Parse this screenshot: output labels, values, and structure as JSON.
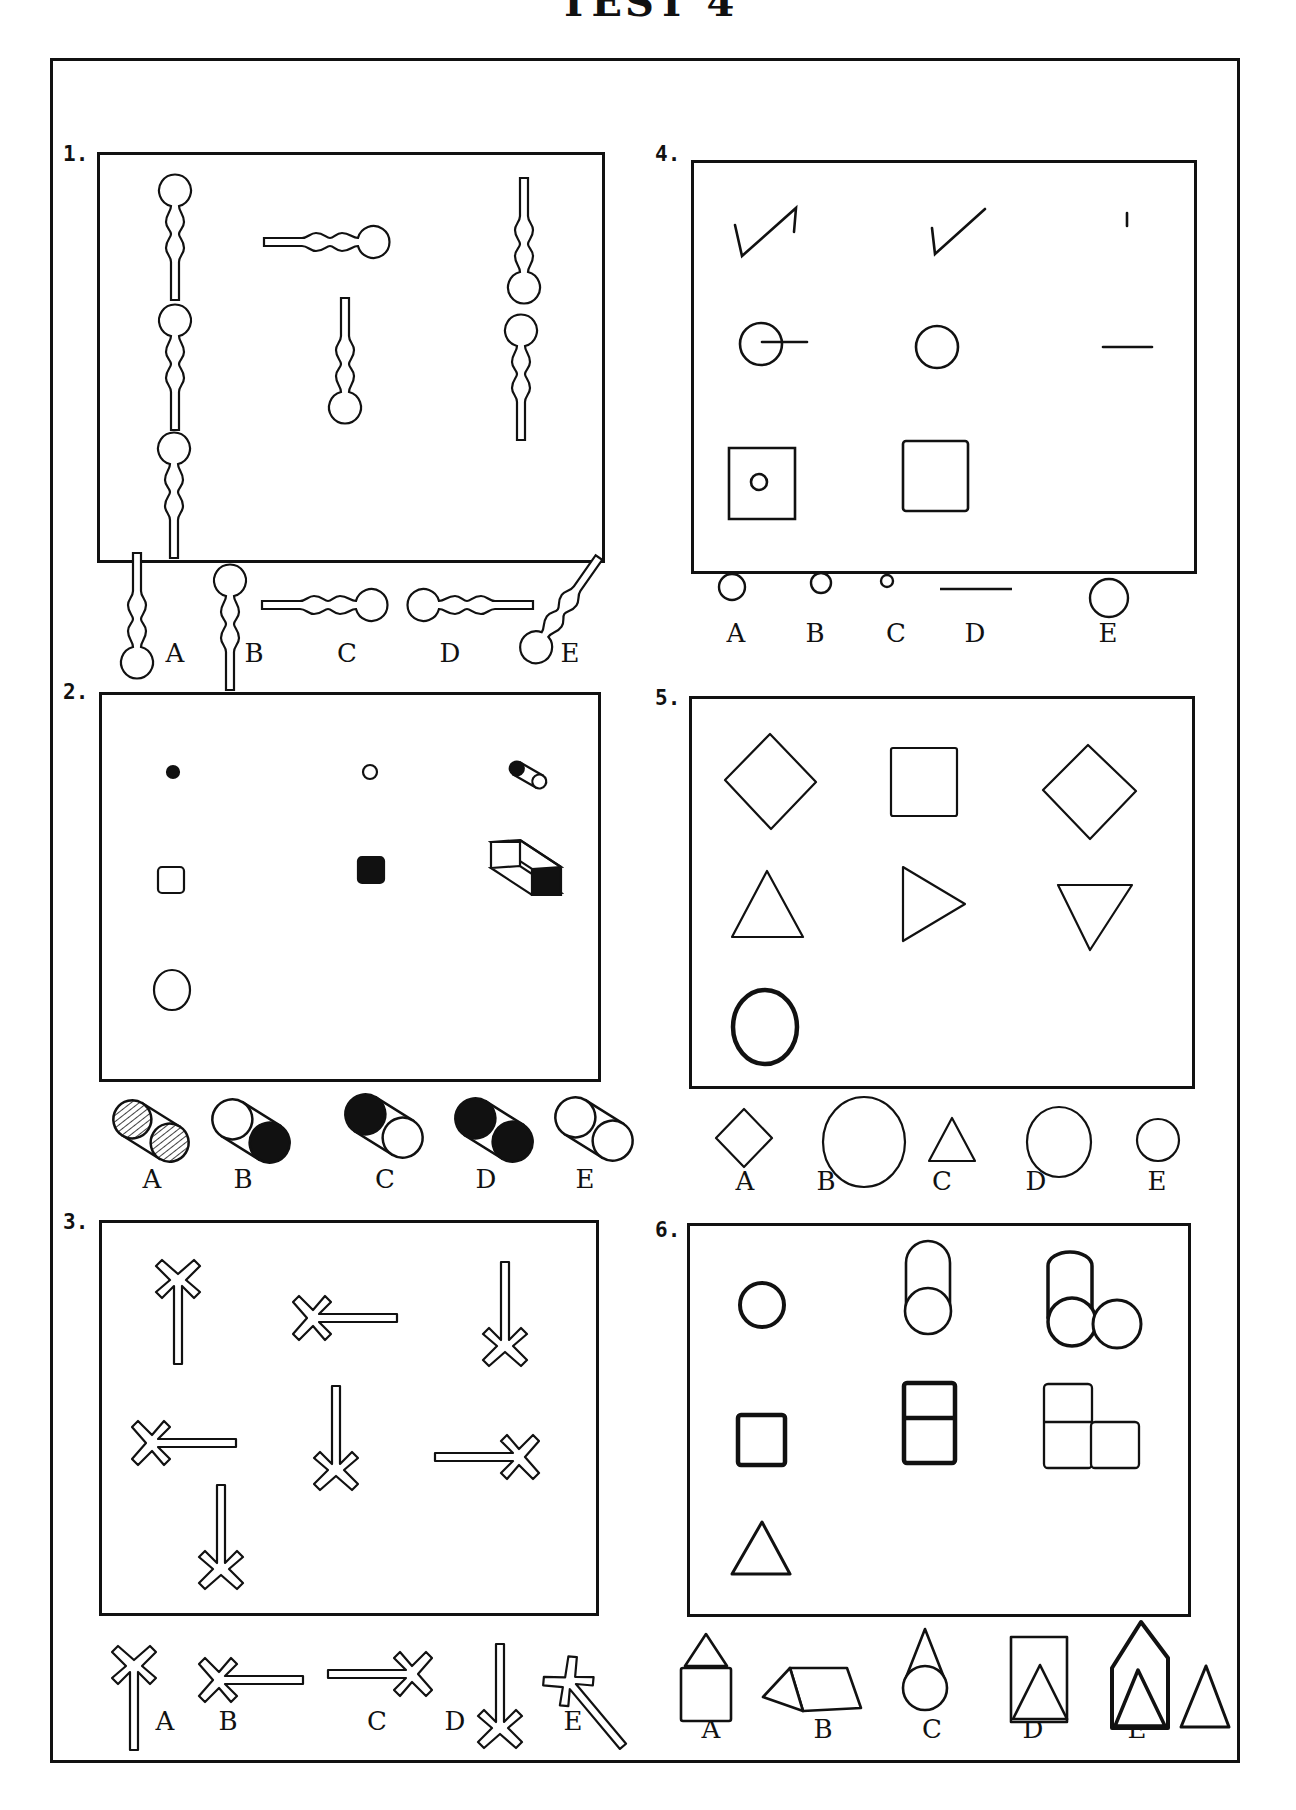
{
  "page": {
    "title": "TEST 4",
    "frame_color": "#111111"
  },
  "questions": [
    {
      "number": "1.",
      "description": "Keyhole shapes (circle head, two bumps, stem) in various orientations; pick the missing one",
      "grid": [
        "keyhole head-up",
        "keyhole head-right horizontal",
        "keyhole head-down",
        "keyhole head-up",
        "keyhole head-down",
        "keyhole head-up",
        "keyhole head-up"
      ],
      "options": [
        {
          "label": "A",
          "figure": "keyhole head-down"
        },
        {
          "label": "B",
          "figure": "keyhole head-up"
        },
        {
          "label": "C",
          "figure": "keyhole horizontal head-right"
        },
        {
          "label": "D",
          "figure": "keyhole horizontal head-left"
        },
        {
          "label": "E",
          "figure": "keyhole diagonal head-down-left"
        }
      ]
    },
    {
      "number": "2.",
      "description": "Dot/circle, square/filled square, and 3D extrusions; pick the cylinder",
      "grid": [
        "small filled dot",
        "small open circle",
        "small cylinder filled-left",
        "small open square",
        "small filled square",
        "box prism filled end",
        "open circle"
      ],
      "options": [
        {
          "label": "A",
          "figure": "cylinder both ends hatched"
        },
        {
          "label": "B",
          "figure": "cylinder open left, filled right"
        },
        {
          "label": "C",
          "figure": "cylinder filled left, open right"
        },
        {
          "label": "D",
          "figure": "cylinder both ends filled"
        },
        {
          "label": "E",
          "figure": "cylinder both ends open"
        }
      ]
    },
    {
      "number": "3.",
      "description": "X-shaped figures with a long stem in different directions",
      "grid": [
        "X stem down",
        "X stem right",
        "X stem up",
        "X stem right (thick)",
        "X stem up",
        "X stem left",
        "X stem up"
      ],
      "options": [
        {
          "label": "A",
          "figure": "X stem down"
        },
        {
          "label": "B",
          "figure": "X stem right"
        },
        {
          "label": "C",
          "figure": "X stem left"
        },
        {
          "label": "D",
          "figure": "X stem up"
        },
        {
          "label": "E",
          "figure": "X stem diagonal"
        }
      ]
    },
    {
      "number": "4.",
      "description": "Subtraction analogies: first minus second equals third",
      "grid": [
        "check with extra vertical",
        "check mark",
        "short vertical tick",
        "circle with line",
        "circle",
        "short horizontal line",
        "square with small circle",
        "square"
      ],
      "options": [
        {
          "label": "A",
          "figure": "medium circle"
        },
        {
          "label": "B",
          "figure": "small circle"
        },
        {
          "label": "C",
          "figure": "tiny circle"
        },
        {
          "label": "D",
          "figure": "horizontal line"
        },
        {
          "label": "E",
          "figure": "large circle"
        }
      ]
    },
    {
      "number": "5.",
      "description": "Rotations of shapes; circle row completion",
      "grid": [
        "diamond",
        "square",
        "diamond",
        "triangle up",
        "triangle right",
        "triangle down",
        "bold circle"
      ],
      "options": [
        {
          "label": "A",
          "figure": "small diamond"
        },
        {
          "label": "B",
          "figure": "large circle"
        },
        {
          "label": "C",
          "figure": "small triangle"
        },
        {
          "label": "D",
          "figure": "medium circle"
        },
        {
          "label": "E",
          "figure": "small circle"
        }
      ]
    },
    {
      "number": "6.",
      "description": "Shape, shape extruded upward, shape extruded plus neighbor",
      "grid": [
        "circle",
        "circle stacked cylinder",
        "cylinder plus circle",
        "square",
        "two stacked squares",
        "L of three squares",
        "triangle"
      ],
      "options": [
        {
          "label": "A",
          "figure": "triangle on square"
        },
        {
          "label": "B",
          "figure": "triangular prism sideways"
        },
        {
          "label": "C",
          "figure": "cone on circle"
        },
        {
          "label": "D",
          "figure": "triangle in rectangle"
        },
        {
          "label": "E",
          "figure": "house shape plus triangle"
        }
      ]
    }
  ]
}
